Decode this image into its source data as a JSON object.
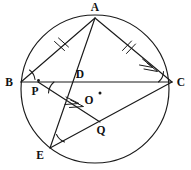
{
  "figure": {
    "stroke_color": "#1a1a1a",
    "background_color": "#ffffff",
    "width": 191,
    "height": 170
  },
  "circle": {
    "name": "circumscribed-circle",
    "center_x": 95,
    "center_y": 89,
    "radius": 74
  },
  "center_point": {
    "label": "O",
    "x": 97,
    "y": 97,
    "label_x": 89,
    "label_y": 104,
    "dot_x": 100,
    "dot_y": 93
  },
  "vertices": [
    {
      "label": "A",
      "x": 95,
      "y": 18,
      "label_x": 95,
      "label_y": 11,
      "has_dot": false
    },
    {
      "label": "B",
      "x": 21,
      "y": 82,
      "label_x": 9,
      "label_y": 86,
      "has_dot": false
    },
    {
      "label": "C",
      "x": 172,
      "y": 82,
      "label_x": 181,
      "label_y": 86,
      "has_dot": false
    },
    {
      "label": "E",
      "x": 50,
      "y": 148,
      "label_x": 40,
      "label_y": 159,
      "has_dot": false
    },
    {
      "label": "D",
      "x": 75,
      "y": 82,
      "label_x": 80,
      "label_y": 78,
      "has_dot": false
    },
    {
      "label": "P",
      "x": 38,
      "y": 82,
      "label_x": 35,
      "label_y": 95,
      "has_dot": true
    },
    {
      "label": "Q",
      "x": 100,
      "y": 122,
      "label_x": 101,
      "label_y": 134,
      "has_dot": false
    }
  ],
  "segments": [
    {
      "name": "segment-bc",
      "from": "B",
      "to": "C",
      "x1": 21,
      "y1": 82,
      "x2": 172,
      "y2": 82
    },
    {
      "name": "segment-ab",
      "from": "A",
      "to": "B",
      "x1": 95,
      "y1": 18,
      "x2": 21,
      "y2": 82
    },
    {
      "name": "segment-ac",
      "from": "A",
      "to": "C",
      "x1": 95,
      "y1": 18,
      "x2": 172,
      "y2": 82
    },
    {
      "name": "segment-ae",
      "from": "A",
      "to": "E",
      "x1": 95,
      "y1": 18,
      "x2": 50,
      "y2": 148
    },
    {
      "name": "segment-ec",
      "from": "E",
      "to": "C",
      "x1": 50,
      "y1": 148,
      "x2": 172,
      "y2": 82
    },
    {
      "name": "segment-pq",
      "from": "P",
      "to": "Q",
      "x1": 38,
      "y1": 82,
      "x2": 100,
      "y2": 122
    }
  ],
  "tick_marks": [
    {
      "name": "tick-mark-ab",
      "on_segment": "segment-ab",
      "count": 2,
      "cx": 61,
      "cy": 47
    },
    {
      "name": "tick-mark-ac",
      "on_segment": "segment-ac",
      "count": 2,
      "cx": 128,
      "cy": 46
    }
  ],
  "arrow_marks": [
    {
      "name": "parallel-arrow-ac",
      "on_segment": "segment-ac",
      "count": 2,
      "cx": 152,
      "cy": 66
    },
    {
      "name": "parallel-arrow-pq",
      "on_segment": "segment-pq",
      "count": 2,
      "cx": 76,
      "cy": 106
    }
  ],
  "angle_arcs": [
    {
      "name": "angle-arc-b",
      "at_vertex": "B"
    },
    {
      "name": "angle-arc-p",
      "at_vertex": "P"
    },
    {
      "name": "angle-arc-c",
      "at_vertex": "C"
    },
    {
      "name": "angle-arc-e",
      "at_vertex": "E"
    }
  ]
}
